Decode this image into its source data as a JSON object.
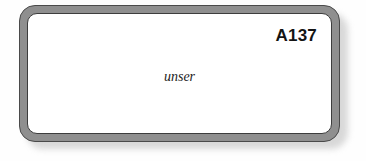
{
  "page": {
    "background_color": "#fefefe",
    "kind": "scanned-flashcard"
  },
  "card": {
    "code_label": "A137",
    "word": "unser",
    "frame_color": "#8f8f8f",
    "frame_outline_color": "#4a4a4a",
    "surface_color": "#ffffff",
    "text_color": "#141414",
    "word_color": "#1c1c1c",
    "shadow_color": "#b9b9b9"
  }
}
